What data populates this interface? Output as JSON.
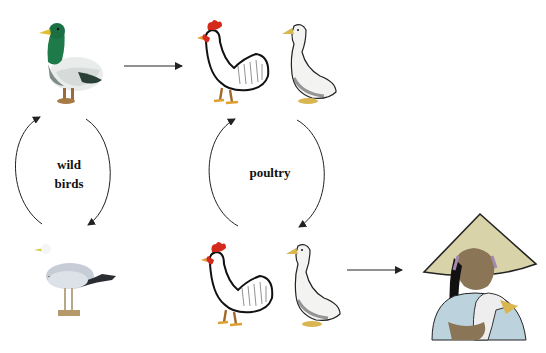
{
  "diagram": {
    "type": "transmission-cycle",
    "groups": [
      {
        "id": "wild",
        "label_lines": [
          "wild",
          "birds"
        ]
      },
      {
        "id": "poultry",
        "label_lines": [
          "poultry"
        ]
      }
    ],
    "nodes": [
      {
        "id": "mallard",
        "icon": "mallard-duck-icon",
        "group": "wild"
      },
      {
        "id": "gull",
        "icon": "seagull-icon",
        "group": "wild"
      },
      {
        "id": "rooster-top",
        "icon": "rooster-icon",
        "group": "poultry"
      },
      {
        "id": "duck-top",
        "icon": "white-duck-icon",
        "group": "poultry"
      },
      {
        "id": "rooster-bottom",
        "icon": "rooster-icon",
        "group": "poultry"
      },
      {
        "id": "duck-bottom",
        "icon": "white-duck-icon",
        "group": "poultry"
      },
      {
        "id": "human",
        "icon": "farmer-woman-holding-duck-icon",
        "group": "humans"
      }
    ],
    "edges": [
      {
        "from": "mallard",
        "to": "rooster-top",
        "style": "straight-arrow"
      },
      {
        "from": "mallard",
        "to": "gull",
        "style": "curved-cycle"
      },
      {
        "from": "gull",
        "to": "mallard",
        "style": "curved-cycle"
      },
      {
        "from": "duck-top",
        "to": "duck-bottom",
        "style": "curved-cycle"
      },
      {
        "from": "rooster-bottom",
        "to": "rooster-top",
        "style": "curved-cycle"
      },
      {
        "from": "duck-bottom",
        "to": "human",
        "style": "straight-arrow"
      }
    ],
    "colors": {
      "background": "#ffffff",
      "arrow": "#222222",
      "mallard_head": "#1f7a4a",
      "beak_yellow": "#e0c030",
      "comb_red": "#d42a1c",
      "feet_orange": "#d9a23a",
      "gull_grey": "#c7cdd6",
      "hat": "#d8d3a8",
      "shirt": "#bcd3de",
      "skin": "#8a7556"
    }
  }
}
